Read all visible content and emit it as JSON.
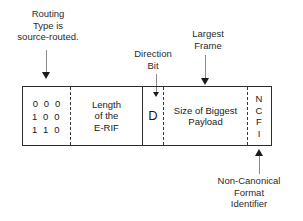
{
  "diagram": {
    "title_text": "Token Ring E-RIF Routing Control field breakdown",
    "callouts": {
      "routing_type": "Routing\nType is\nsource-routed.",
      "direction_bit": "Direction\nBit",
      "largest_frame": "Largest\nFrame",
      "ncfi": "Non-Canonical\nFormat\nIdentifier"
    },
    "fields": [
      {
        "name": "routing-type",
        "text": "0 0 0\n1 0 0\n1 1 0"
      },
      {
        "name": "erif-length",
        "text": "Length\nof the\nE-RIF"
      },
      {
        "name": "direction-bit",
        "text": "D"
      },
      {
        "name": "largest-frame",
        "text": "Size of Biggest\nPayload"
      },
      {
        "name": "ncfi",
        "text": "N\nC\nF\nI"
      }
    ],
    "colors": {
      "ink": "#1a1a1a",
      "border": "#2b2b2b",
      "leader": "#8c8c8c",
      "background": "#ffffff"
    }
  }
}
